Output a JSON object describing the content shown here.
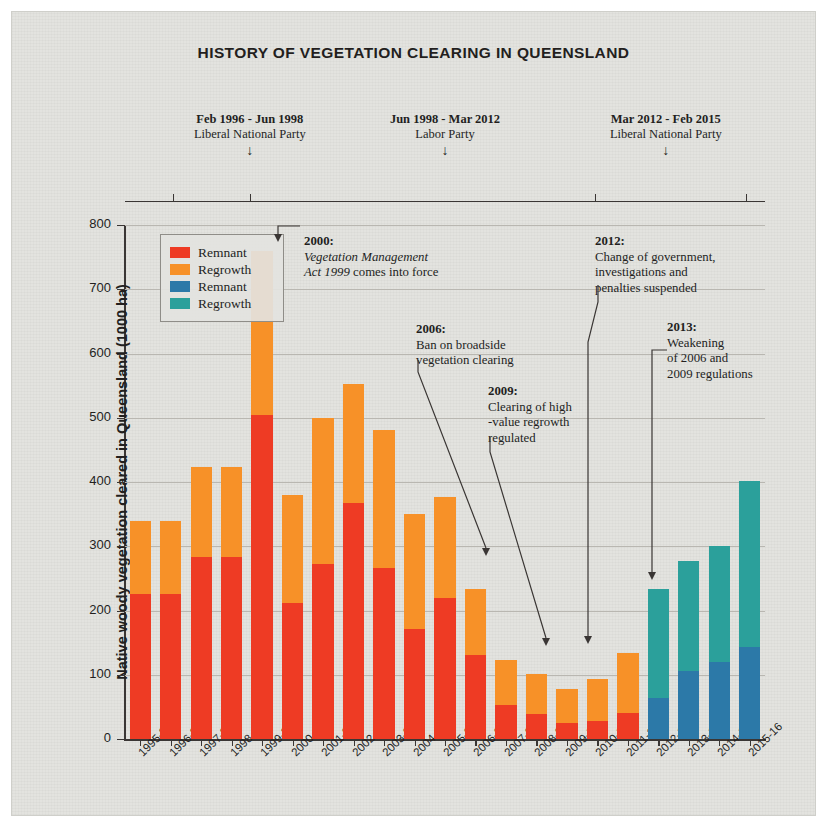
{
  "title": "HISTORY OF VEGETATION CLEARING IN QUEENSLAND",
  "colors": {
    "remnant_red": "#ee3b24",
    "regrowth_orange": "#f79128",
    "remnant_blue": "#2c79a8",
    "regrowth_teal": "#2ba09b",
    "background": "#e3e3df",
    "axis": "#3a3634",
    "grid": "#b9b7b1"
  },
  "governments": [
    {
      "period": "Feb 1996 - Jun 1998",
      "party": "Liberal National Party",
      "arrow": "↓"
    },
    {
      "period": "Jun 1998 - Mar 2012",
      "party": "Labor Party",
      "arrow": "↓"
    },
    {
      "period": "Mar 2012 - Feb 2015",
      "party": "Liberal National Party",
      "arrow": "↓"
    }
  ],
  "legend": [
    {
      "label": "Remnant",
      "color": "#ee3b24"
    },
    {
      "label": "Regrowth",
      "color": "#f79128"
    },
    {
      "label": "Remnant",
      "color": "#2c79a8"
    },
    {
      "label": "Regrowth",
      "color": "#2ba09b"
    }
  ],
  "annotations": [
    {
      "id": "2000",
      "year": "2000:",
      "lines": [
        "Vegetation Management",
        "Act 1999 comes into force"
      ],
      "italic_prefix": "Vegetation Management Act 1999",
      "target": "1999-2000"
    },
    {
      "id": "2006",
      "year": "2006:",
      "lines": [
        "Ban on broadside",
        "vegetation clearing"
      ],
      "target": "2006-07"
    },
    {
      "id": "2009",
      "year": "2009:",
      "lines": [
        "Clearing of high",
        "-value regrowth",
        "regulated"
      ],
      "target": "2008-09"
    },
    {
      "id": "2012",
      "year": "2012:",
      "lines": [
        "Change of government,",
        "investigations and",
        "penalties suspended"
      ],
      "target": "2011-12"
    },
    {
      "id": "2013",
      "year": "2013:",
      "lines": [
        "Weakening",
        "of 2006 and",
        "2009 regulations"
      ],
      "target": "2012-13"
    }
  ],
  "chart_data": {
    "type": "bar",
    "stacked": true,
    "title": "HISTORY OF VEGETATION CLEARING IN QUEENSLAND",
    "xlabel": "",
    "ylabel": "Native woody vegetation cleared in Queensland (1000 ha)",
    "ylim": [
      0,
      800
    ],
    "yticks": [
      0,
      100,
      200,
      300,
      400,
      500,
      600,
      700,
      800
    ],
    "grid": true,
    "legend_position": "inside-top-left",
    "categories": [
      "1995-96",
      "1996-97",
      "1997-98",
      "1998-99",
      "1999-2000",
      "2000-01",
      "2001-02",
      "2002-03",
      "2003-04",
      "2004-05",
      "2005-06",
      "2006-07",
      "2007-08",
      "2008-09",
      "2009-10",
      "2010-11",
      "2011-12",
      "2012-13",
      "2013-14",
      "2014-15",
      "2015-16"
    ],
    "series": [
      {
        "name": "Remnant",
        "color": "#ee3b24",
        "values": [
          225,
          225,
          283,
          284,
          505,
          212,
          273,
          368,
          266,
          171,
          220,
          131,
          53,
          39,
          25,
          28,
          40,
          null,
          null,
          null,
          null
        ]
      },
      {
        "name": "Regrowth",
        "color": "#f79128",
        "values": [
          115,
          115,
          140,
          140,
          255,
          168,
          227,
          185,
          215,
          180,
          156,
          102,
          70,
          62,
          53,
          65,
          94,
          null,
          null,
          null,
          null
        ]
      },
      {
        "name": "Remnant",
        "color": "#2c79a8",
        "values": [
          null,
          null,
          null,
          null,
          null,
          null,
          null,
          null,
          null,
          null,
          null,
          null,
          null,
          null,
          null,
          null,
          null,
          64,
          106,
          120,
          143
        ]
      },
      {
        "name": "Regrowth",
        "color": "#2ba09b",
        "values": [
          null,
          null,
          null,
          null,
          null,
          null,
          null,
          null,
          null,
          null,
          null,
          null,
          null,
          null,
          null,
          null,
          null,
          169,
          171,
          180,
          259
        ]
      }
    ],
    "totals": [
      340,
      340,
      423,
      424,
      760,
      380,
      500,
      553,
      481,
      351,
      376,
      233,
      123,
      101,
      78,
      93,
      134,
      233,
      277,
      300,
      402
    ]
  }
}
